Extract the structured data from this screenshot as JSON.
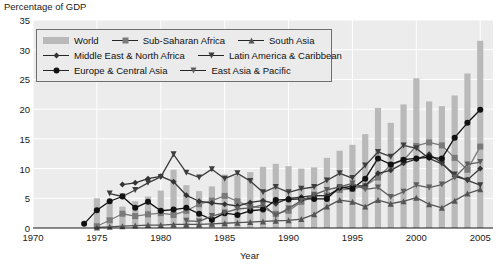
{
  "chart_data": {
    "type": "bar",
    "title": "",
    "ylabel": "Percentage of GDP",
    "xlabel": "Year",
    "ylim": [
      0,
      35
    ],
    "xlim": [
      1970,
      2006
    ],
    "yticks": [
      0,
      5,
      10,
      15,
      20,
      25,
      30,
      35
    ],
    "xticks": [
      1970,
      1975,
      1980,
      1985,
      1990,
      1995,
      2000,
      2005
    ],
    "grid": true,
    "legend_position": "top-left",
    "bar_series": {
      "name": "World",
      "color": "#b9b9b9",
      "x": [
        1975,
        1976,
        1977,
        1978,
        1979,
        1980,
        1981,
        1982,
        1983,
        1984,
        1985,
        1986,
        1987,
        1988,
        1989,
        1990,
        1991,
        1992,
        1993,
        1994,
        1995,
        1996,
        1997,
        1998,
        1999,
        2000,
        2001,
        2002,
        2003,
        2004,
        2005
      ],
      "values": [
        5.0,
        4.2,
        3.6,
        4.5,
        5.3,
        6.3,
        9.8,
        7.2,
        6.2,
        7.0,
        9.0,
        8.8,
        9.4,
        10.3,
        10.8,
        10.4,
        10.0,
        10.2,
        11.8,
        13.0,
        14.0,
        15.8,
        20.2,
        17.7,
        20.8,
        25.2,
        21.3,
        20.5,
        22.3,
        26.0,
        31.5
      ]
    },
    "series": [
      {
        "name": "Sub-Saharan Africa",
        "marker": "square",
        "color": "#7a7a7a",
        "x": [
          1975,
          1976,
          1977,
          1978,
          1979,
          1980,
          1981,
          1982,
          1983,
          1984,
          1985,
          1986,
          1987,
          1988,
          1989,
          1990,
          1991,
          1992,
          1993,
          1994,
          1995,
          1996,
          1997,
          1998,
          1999,
          2000,
          2001,
          2002,
          2003,
          2004,
          2005
        ],
        "values": [
          0.3,
          1.3,
          2.4,
          2.0,
          2.3,
          2.5,
          2.2,
          2.9,
          4.0,
          4.6,
          5.4,
          4.5,
          3.6,
          3.4,
          2.4,
          2.9,
          4.4,
          5.4,
          5.5,
          6.4,
          6.6,
          7.1,
          8.5,
          10.6,
          11.4,
          13.8,
          14.4,
          13.9,
          11.8,
          9.8,
          13.7
        ]
      },
      {
        "name": "South Asia",
        "marker": "triangle-up",
        "color": "#545454",
        "x": [
          1975,
          1976,
          1977,
          1978,
          1979,
          1980,
          1981,
          1982,
          1983,
          1984,
          1985,
          1986,
          1987,
          1988,
          1989,
          1990,
          1991,
          1992,
          1993,
          1994,
          1995,
          1996,
          1997,
          1998,
          1999,
          2000,
          2001,
          2002,
          2003,
          2004,
          2005
        ],
        "values": [
          0.1,
          0.2,
          0.3,
          0.4,
          0.5,
          0.5,
          0.6,
          0.6,
          0.6,
          0.7,
          0.8,
          0.9,
          1.0,
          1.1,
          1.2,
          1.3,
          1.5,
          2.3,
          3.6,
          4.7,
          4.4,
          3.6,
          4.7,
          4.1,
          4.5,
          5.1,
          4.0,
          3.4,
          4.6,
          5.8,
          6.5
        ]
      },
      {
        "name": "Middle East & North Africa",
        "marker": "diamond",
        "color": "#333333",
        "x": [
          1977,
          1978,
          1979,
          1980,
          1981,
          1982,
          1983,
          1984,
          1985,
          1986,
          1987,
          1988,
          1989,
          1990,
          1991,
          1992,
          1993,
          1994,
          1995,
          1996,
          1997,
          1998,
          1999,
          2000,
          2001,
          2002,
          2003,
          2004,
          2005
        ],
        "values": [
          7.3,
          7.6,
          8.3,
          8.7,
          7.8,
          5.5,
          4.5,
          4.2,
          4.0,
          3.7,
          4.3,
          4.6,
          4.1,
          5.0,
          5.2,
          5.5,
          5.4,
          6.7,
          7.1,
          7.1,
          9.2,
          9.7,
          10.9,
          11.6,
          12.4,
          11.0,
          8.7,
          8.1,
          10.0
        ]
      },
      {
        "name": "Latin America & Caribbean",
        "marker": "triangle-down",
        "color": "#3d3d3d",
        "x": [
          1976,
          1977,
          1978,
          1979,
          1980,
          1981,
          1982,
          1983,
          1984,
          1985,
          1986,
          1987,
          1988,
          1989,
          1990,
          1991,
          1992,
          1993,
          1994,
          1995,
          1996,
          1997,
          1998,
          1999,
          2000,
          2001,
          2002,
          2003,
          2004,
          2005
        ],
        "values": [
          5.8,
          5.3,
          6.4,
          7.6,
          8.6,
          12.4,
          9.3,
          8.5,
          9.9,
          8.3,
          9.2,
          7.9,
          6.0,
          6.9,
          6.0,
          6.6,
          6.9,
          8.0,
          9.2,
          8.4,
          10.5,
          12.8,
          12.0,
          13.9,
          13.4,
          11.7,
          10.8,
          9.0,
          8.0,
          7.2
        ]
      },
      {
        "name": "Europe & Central Asia",
        "marker": "circle",
        "color": "#111111",
        "x": [
          1974,
          1975,
          1976,
          1977,
          1978,
          1979,
          1980,
          1981,
          1982,
          1983,
          1984,
          1985,
          1986,
          1987,
          1988,
          1989,
          1990,
          1991,
          1992,
          1993,
          1994,
          1995,
          1996,
          1997,
          1998,
          1999,
          2000,
          2001,
          2002,
          2003,
          2004,
          2005
        ],
        "values": [
          0.7,
          3.0,
          4.5,
          5.3,
          3.4,
          4.4,
          2.9,
          3.1,
          3.4,
          2.4,
          1.4,
          2.5,
          2.2,
          2.9,
          3.1,
          4.7,
          4.8,
          4.9,
          4.9,
          4.9,
          6.9,
          6.6,
          8.3,
          11.7,
          10.7,
          11.5,
          11.7,
          11.9,
          11.7,
          15.2,
          17.7,
          19.9
        ]
      },
      {
        "name": "East Asia & Pacific",
        "marker": "triangle-down-open",
        "color": "#5e5e5e",
        "x": [
          1982,
          1983,
          1984,
          1985,
          1986,
          1987,
          1988,
          1989,
          1990,
          1991,
          1992,
          1993,
          1994,
          1995,
          1996,
          1997,
          1998,
          1999,
          2000,
          2001,
          2002,
          2003,
          2004,
          2005
        ],
        "values": [
          1.2,
          1.1,
          2.0,
          2.6,
          3.2,
          3.4,
          3.9,
          2.1,
          3.3,
          4.6,
          5.6,
          6.4,
          6.9,
          7.5,
          6.5,
          6.8,
          5.2,
          6.1,
          7.2,
          6.8,
          7.3,
          8.5,
          10.7,
          11.1
        ]
      }
    ]
  },
  "legend": {
    "rows": [
      [
        {
          "label": "World",
          "marker": "bar"
        },
        {
          "label": "Sub-Saharan Africa",
          "marker": "square"
        },
        {
          "label": "South Asia",
          "marker": "triangle-up"
        }
      ],
      [
        {
          "label": "Middle East & North Africa",
          "marker": "diamond"
        },
        {
          "label": "Latin America & Caribbean",
          "marker": "triangle-down"
        }
      ],
      [
        {
          "label": "Europe & Central Asia",
          "marker": "circle"
        },
        {
          "label": "East Asia & Pacific",
          "marker": "triangle-down-open"
        }
      ]
    ]
  }
}
